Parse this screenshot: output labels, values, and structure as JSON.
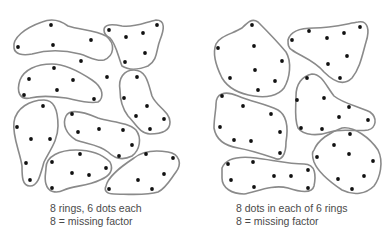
{
  "figure": {
    "colors": {
      "ring_stroke": "#8a8a8a",
      "dot_fill": "#111111",
      "caption_text": "#4a4a4a",
      "background": "#ffffff"
    }
  },
  "left_panel": {
    "caption_line1": "8 rings, 6 dots each",
    "caption_line2": "8 = missing factor",
    "ring_count": 8,
    "dots_per_ring": 6,
    "rings": [
      {
        "path": "M14,48 C12,38 25,28 42,22 C52,18 60,20 68,26 C80,30 95,30 106,36 C116,44 114,56 104,60 C96,62 88,56 80,54 C64,50 46,50 32,54 C22,56 15,54 14,48 Z",
        "dots": [
          [
            51,
            25
          ],
          [
            18,
            47
          ],
          [
            53,
            45
          ],
          [
            91,
            40
          ],
          [
            81,
            61
          ],
          [
            107,
            77
          ]
        ]
      },
      {
        "path": "M104,30 C104,24 112,24 122,26 C134,28 146,22 156,20 C166,20 164,30 160,40 C156,50 158,60 148,66 C138,70 128,70 122,66 C118,56 116,44 110,38 C106,36 104,34 104,30 Z",
        "dots": [
          [
            109,
            30
          ],
          [
            126,
            37
          ],
          [
            143,
            33
          ],
          [
            157,
            25
          ],
          [
            145,
            53
          ],
          [
            125,
            62
          ]
        ]
      },
      {
        "path": "M20,80 C24,70 36,64 52,64 C66,64 80,72 92,80 C104,88 104,98 98,102 C88,104 76,100 66,98 C52,96 38,96 30,98 C20,100 16,92 20,80 Z",
        "dots": [
          [
            54,
            68
          ],
          [
            29,
            79
          ],
          [
            73,
            80
          ],
          [
            57,
            90
          ],
          [
            24,
            95
          ],
          [
            94,
            99
          ]
        ]
      },
      {
        "path": "M120,90 C118,78 124,70 134,70 C146,70 148,82 152,96 C156,106 170,112 170,122 C170,132 160,134 150,134 C140,134 136,124 128,116 C122,108 120,98 120,90 Z",
        "dots": [
          [
            137,
            77
          ],
          [
            124,
            98
          ],
          [
            147,
            106
          ],
          [
            136,
            116
          ],
          [
            164,
            119
          ],
          [
            150,
            129
          ]
        ]
      },
      {
        "path": "M14,122 C16,108 30,100 44,100 C56,100 58,114 58,126 C58,140 50,150 44,162 C40,176 38,186 30,186 C22,186 22,176 22,166 C20,152 12,136 14,122 Z",
        "dots": [
          [
            43,
            106
          ],
          [
            17,
            127
          ],
          [
            31,
            139
          ],
          [
            50,
            139
          ],
          [
            26,
            163
          ],
          [
            30,
            180
          ]
        ]
      },
      {
        "path": "M66,116 C70,108 84,112 98,118 C110,122 128,122 136,130 C142,138 140,150 132,156 C124,160 116,160 108,152 C98,144 86,144 76,140 C66,134 62,124 66,116 Z",
        "dots": [
          [
            72,
            114
          ],
          [
            78,
            132
          ],
          [
            99,
            129
          ],
          [
            123,
            130
          ],
          [
            132,
            145
          ],
          [
            119,
            156
          ]
        ]
      },
      {
        "path": "M46,168 C46,156 60,150 76,150 C92,150 102,154 110,162 C114,170 110,176 100,180 C88,186 72,186 64,190 C56,194 48,192 46,184 C44,178 46,172 46,168 Z",
        "dots": [
          [
            80,
            154
          ],
          [
            52,
            162
          ],
          [
            72,
            173
          ],
          [
            89,
            175
          ],
          [
            106,
            168
          ],
          [
            52,
            188
          ]
        ]
      },
      {
        "path": "M106,186 C108,176 122,166 134,158 C144,150 156,150 168,152 C180,154 182,164 176,172 C170,180 166,188 158,192 C146,196 126,194 114,194 C106,194 104,190 106,186 Z",
        "dots": [
          [
            146,
            154
          ],
          [
            173,
            158
          ],
          [
            138,
            180
          ],
          [
            164,
            174
          ],
          [
            109,
            189
          ],
          [
            152,
            189
          ]
        ]
      }
    ]
  },
  "right_panel": {
    "caption_line1": "8 dots in each of 6 rings",
    "caption_line2": "8 = missing factor",
    "ring_count": 6,
    "dots_per_ring": 8,
    "rings": [
      {
        "path": "M216,44 C220,36 232,34 242,28 C248,22 252,18 258,22 C266,30 276,40 286,52 C292,62 290,78 284,88 C278,96 266,98 254,96 C240,94 228,88 222,78 C216,66 212,54 216,44 Z",
        "dots": [
          [
            252,
            25
          ],
          [
            218,
            48
          ],
          [
            254,
            46
          ],
          [
            282,
            61
          ],
          [
            255,
            70
          ],
          [
            230,
            78
          ],
          [
            275,
            81
          ],
          [
            258,
            90
          ]
        ]
      },
      {
        "path": "M288,40 C290,32 300,28 314,28 C330,28 346,24 358,22 C368,20 370,30 366,42 C362,56 360,68 352,78 C344,86 334,82 324,72 C314,60 300,56 292,50 C288,48 288,44 288,40 Z",
        "dots": [
          [
            309,
            31
          ],
          [
            292,
            40
          ],
          [
            327,
            38
          ],
          [
            344,
            33
          ],
          [
            360,
            27
          ],
          [
            347,
            56
          ],
          [
            328,
            64
          ],
          [
            340,
            78
          ]
        ]
      },
      {
        "path": "M216,104 C216,94 224,90 238,96 C252,102 266,104 278,110 C288,116 288,130 286,142 C286,154 282,162 274,158 C262,154 250,150 238,148 C226,146 216,140 214,128 C214,118 216,110 216,104 Z",
        "dots": [
          [
            222,
            96
          ],
          [
            243,
            106
          ],
          [
            271,
            114
          ],
          [
            220,
            127
          ],
          [
            234,
            140
          ],
          [
            251,
            141
          ],
          [
            280,
            132
          ],
          [
            280,
            153
          ]
        ]
      },
      {
        "path": "M296,96 C296,84 302,76 312,74 C322,74 326,86 334,96 C344,104 358,106 370,112 C378,118 376,128 368,130 C356,132 342,128 330,132 C318,136 304,136 298,128 C294,118 296,108 296,96 Z",
        "dots": [
          [
            307,
            78
          ],
          [
            297,
            100
          ],
          [
            324,
            98
          ],
          [
            349,
            107
          ],
          [
            339,
            117
          ],
          [
            368,
            120
          ],
          [
            301,
            128
          ],
          [
            322,
            129
          ]
        ]
      },
      {
        "path": "M222,168 C226,158 240,156 256,158 C272,160 290,164 304,164 C316,164 316,176 314,186 C312,194 300,192 288,188 C272,184 256,192 244,194 C232,194 222,188 222,178 Z",
        "dots": [
          [
            228,
            164
          ],
          [
            253,
            162
          ],
          [
            231,
            180
          ],
          [
            254,
            187
          ],
          [
            274,
            176
          ],
          [
            291,
            176
          ],
          [
            308,
            170
          ],
          [
            308,
            188
          ]
        ]
      },
      {
        "path": "M314,150 C318,140 330,132 342,128 C354,126 370,138 378,150 C384,162 380,178 374,186 C366,194 354,196 342,190 C330,182 318,172 314,162 C312,156 312,152 314,150 Z",
        "dots": [
          [
            350,
            134
          ],
          [
            334,
            145
          ],
          [
            349,
            154
          ],
          [
            317,
            157
          ],
          [
            373,
            161
          ],
          [
            338,
            179
          ],
          [
            364,
            176
          ],
          [
            352,
            189
          ]
        ]
      }
    ]
  }
}
